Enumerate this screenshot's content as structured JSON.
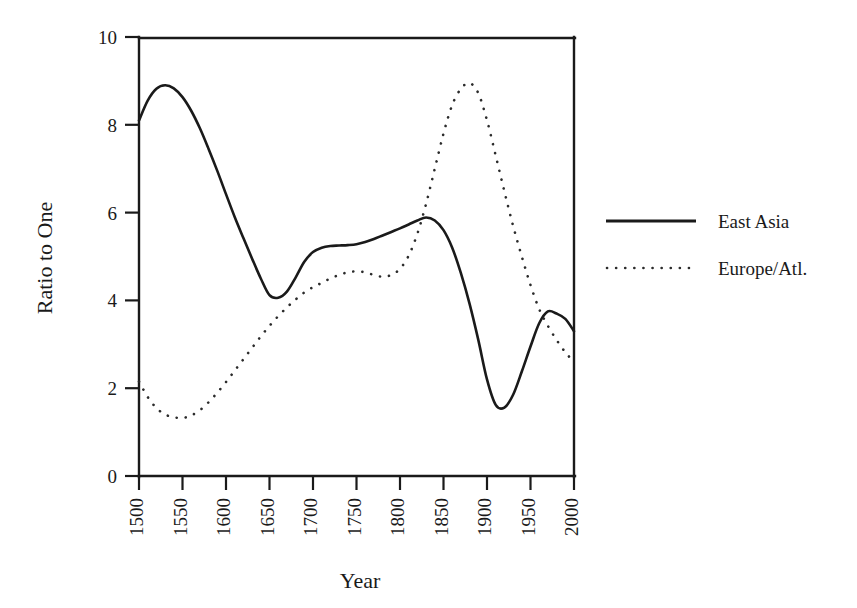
{
  "chart_data": {
    "type": "line",
    "title": "",
    "xlabel": "Year",
    "ylabel": "Ratio to One",
    "xlim": [
      1500,
      2000
    ],
    "ylim": [
      0,
      10
    ],
    "grid": false,
    "legend_position": "right-outside",
    "xticks": [
      1500,
      1550,
      1600,
      1650,
      1700,
      1750,
      1800,
      1850,
      1900,
      1950,
      2000
    ],
    "xtick_labels": [
      "1500",
      "1550",
      "1600",
      "1650",
      "1700",
      "1750",
      "1800",
      "1850",
      "1900",
      "1950",
      "2000"
    ],
    "xtick_rotation": 90,
    "yticks": [
      0,
      2,
      4,
      6,
      8,
      10
    ],
    "ytick_labels": [
      "0",
      "2",
      "4",
      "6",
      "8",
      "10"
    ],
    "x": [
      1500,
      1510,
      1520,
      1530,
      1540,
      1550,
      1560,
      1570,
      1580,
      1590,
      1600,
      1610,
      1620,
      1630,
      1640,
      1650,
      1660,
      1670,
      1680,
      1690,
      1700,
      1710,
      1720,
      1730,
      1740,
      1750,
      1760,
      1770,
      1780,
      1790,
      1800,
      1810,
      1820,
      1830,
      1840,
      1850,
      1860,
      1870,
      1880,
      1890,
      1900,
      1910,
      1920,
      1930,
      1940,
      1950,
      1960,
      1970,
      1980,
      1990,
      2000
    ],
    "series": [
      {
        "name": "East Asia",
        "style": "solid",
        "color": "#1a1a1a",
        "values": [
          8.1,
          8.55,
          8.82,
          8.9,
          8.83,
          8.63,
          8.32,
          7.92,
          7.45,
          6.95,
          6.42,
          5.9,
          5.42,
          4.95,
          4.5,
          4.12,
          4.06,
          4.2,
          4.52,
          4.88,
          5.1,
          5.2,
          5.24,
          5.25,
          5.26,
          5.28,
          5.33,
          5.4,
          5.48,
          5.56,
          5.64,
          5.73,
          5.82,
          5.89,
          5.82,
          5.6,
          5.2,
          4.62,
          3.92,
          3.1,
          2.2,
          1.62,
          1.56,
          1.85,
          2.38,
          2.95,
          3.48,
          3.75,
          3.7,
          3.58,
          3.3
        ]
      },
      {
        "name": "Europe/Atl.",
        "style": "dotted",
        "color": "#2b2b2b",
        "values": [
          2.15,
          1.8,
          1.55,
          1.4,
          1.34,
          1.32,
          1.38,
          1.5,
          1.68,
          1.9,
          2.14,
          2.4,
          2.66,
          2.92,
          3.18,
          3.42,
          3.64,
          3.84,
          4.02,
          4.18,
          4.3,
          4.4,
          4.5,
          4.58,
          4.64,
          4.66,
          4.64,
          4.58,
          4.54,
          4.58,
          4.72,
          5.02,
          5.52,
          6.2,
          7.0,
          7.8,
          8.45,
          8.82,
          8.95,
          8.72,
          8.1,
          7.3,
          6.48,
          5.7,
          5.0,
          4.35,
          3.8,
          3.42,
          3.1,
          2.82,
          2.6
        ]
      }
    ]
  },
  "legend": {
    "entries": [
      {
        "label": "East Asia"
      },
      {
        "label": "Europe/Atl."
      }
    ]
  },
  "axes": {
    "x_title": "Year",
    "y_title": "Ratio to One"
  }
}
